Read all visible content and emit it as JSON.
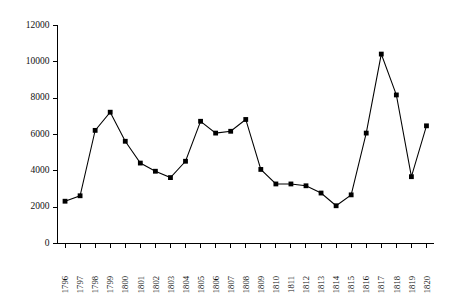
{
  "chart_data": {
    "type": "line",
    "title": "",
    "subtitle": "",
    "xlabel": "",
    "ylabel": "",
    "categories": [
      "1796",
      "1797",
      "1798",
      "1799",
      "1800",
      "1801",
      "1802",
      "1803",
      "1804",
      "1805",
      "1806",
      "1807",
      "1808",
      "1809",
      "1810",
      "1811",
      "1812",
      "1813",
      "1814",
      "1815",
      "1816",
      "1817",
      "1818",
      "1819",
      "1820"
    ],
    "values": [
      2300,
      2600,
      6200,
      7200,
      5600,
      4400,
      3950,
      3600,
      4500,
      6700,
      6050,
      6150,
      6800,
      4050,
      3250,
      3250,
      3150,
      2750,
      2050,
      2650,
      6050,
      10400,
      8150,
      3650,
      6450
    ],
    "series": [
      {
        "name": "series-1",
        "values": [
          2300,
          2600,
          6200,
          7200,
          5600,
          4400,
          3950,
          3600,
          4500,
          6700,
          6050,
          6150,
          6800,
          4050,
          3250,
          3250,
          3150,
          2750,
          2050,
          2650,
          6050,
          10400,
          8150,
          3650,
          6450
        ]
      }
    ],
    "ylim": [
      0,
      12000
    ],
    "yticks": [
      0,
      2000,
      4000,
      6000,
      8000,
      10000,
      12000
    ],
    "ytick_labels": [
      "0",
      "2000",
      "4000",
      "6000",
      "8000",
      "10000",
      "12000"
    ],
    "xtick_labels": [
      "1796",
      "1797",
      "1798",
      "1799",
      "1800",
      "1801",
      "1802",
      "1803",
      "1804",
      "1805",
      "1806",
      "1807",
      "1808",
      "1809",
      "1810",
      "1811",
      "1812",
      "1813",
      "1814",
      "1815",
      "1816",
      "1817",
      "1818",
      "1819",
      "1820"
    ],
    "grid": false,
    "legend": "none",
    "marker": "square",
    "line_color": "#000000",
    "marker_color": "#000000",
    "background_color": "#ffffff"
  }
}
